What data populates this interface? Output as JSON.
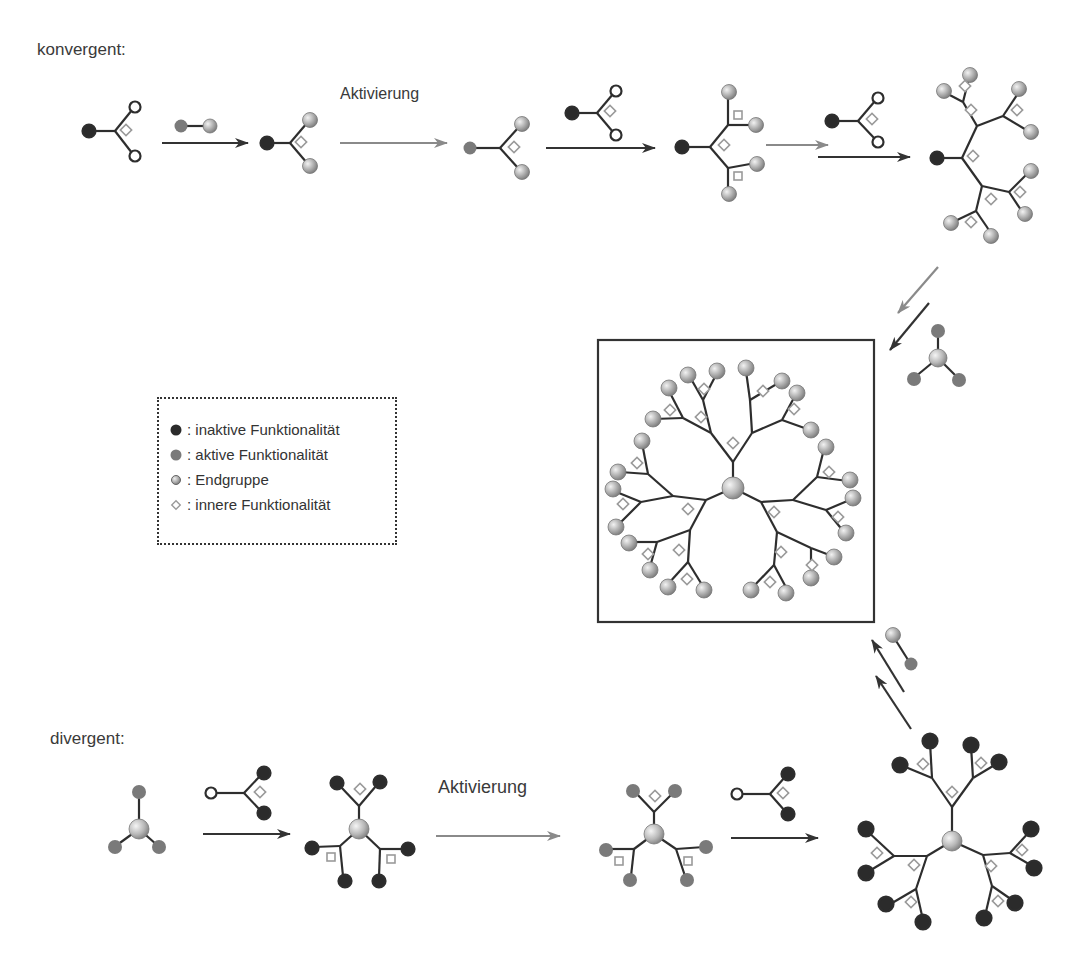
{
  "sections": {
    "convergent": {
      "label": "konvergent:"
    },
    "divergent": {
      "label": "divergent:"
    }
  },
  "arrows": {
    "activation_top": "Aktivierung",
    "activation_bottom": "Aktivierung"
  },
  "legend": {
    "items": [
      {
        "symbol": "dark-filled-circle",
        "label": ": inaktive Funktionalität"
      },
      {
        "symbol": "gray-filled-circle",
        "label": ": aktive Funktionalität"
      },
      {
        "symbol": "shaded-sphere",
        "label": ": Endgruppe"
      },
      {
        "symbol": "open-diamond",
        "label": ": innere Funktionalität"
      }
    ]
  },
  "colors": {
    "inactive": "#2b2b2b",
    "active": "#7a7a7a",
    "endgroup": "#b5b5b5",
    "diamond": "#9a9a9a",
    "bond": "#2e2e2e",
    "arrow_dark": "#333333",
    "arrow_light": "#8a8a8a"
  }
}
